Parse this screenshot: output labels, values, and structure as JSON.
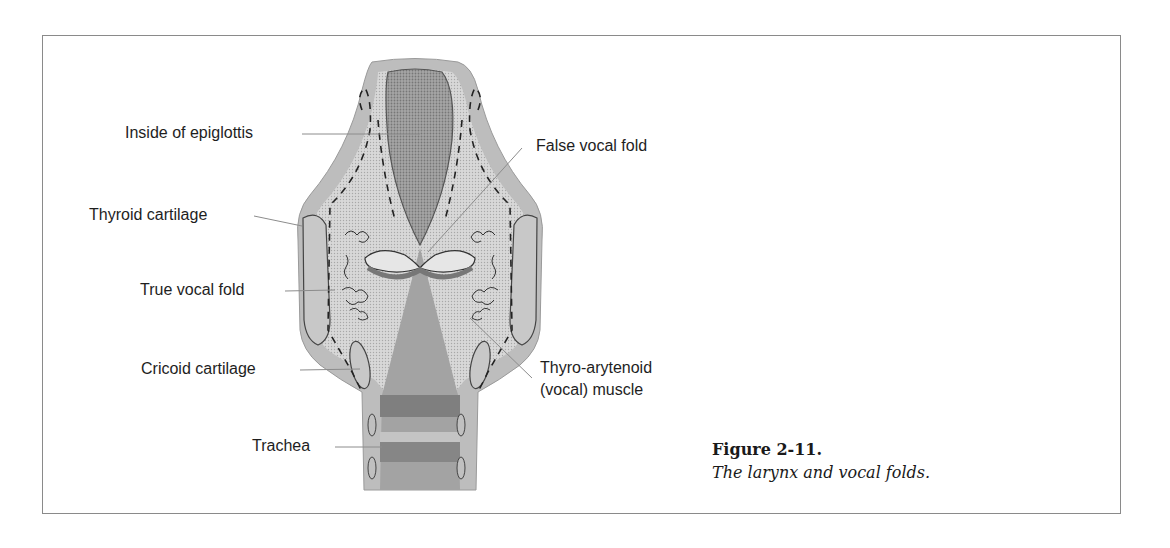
{
  "figure": {
    "number": "Figure 2-11.",
    "caption": "The larynx and vocal folds.",
    "labels": {
      "inside_epiglottis": "Inside of epiglottis",
      "thyroid_cartilage": "Thyroid cartilage",
      "true_vocal_fold": "True vocal fold",
      "cricoid_cartilage": "Cricoid cartilage",
      "trachea": "Trachea",
      "false_vocal_fold": "False vocal fold",
      "thyro_arytenoid_line1": "Thyro-arytenoid",
      "thyro_arytenoid_line2": "(vocal) muscle"
    },
    "colors": {
      "outer_tissue": "#b9b9b9",
      "inner_tissue": "#dcdcdc",
      "airway": "#9a9a9a",
      "cartilage": "#c6c6c6",
      "ring_dark": "#7d7d7d",
      "leader_line": "#8c8c8c",
      "frame": "#8a8a8a"
    }
  }
}
